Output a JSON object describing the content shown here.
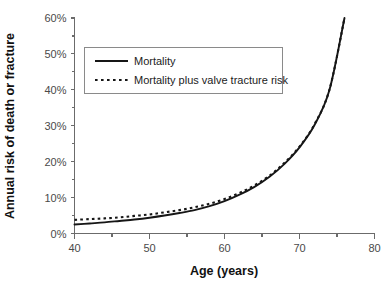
{
  "chart_data": {
    "type": "line",
    "title": "",
    "xlabel": "Age (years)",
    "ylabel": "Annual risk of death or fracture",
    "xlim": [
      40,
      80
    ],
    "ylim": [
      0,
      60
    ],
    "grid": false,
    "legend_position": "upper-left-inside",
    "x_ticks": [
      "40",
      "50",
      "60",
      "70",
      "80"
    ],
    "x_tick_values": [
      40,
      50,
      60,
      70,
      80
    ],
    "x_minor_tick_values": [
      45,
      55,
      65,
      75
    ],
    "y_ticks": [
      "0%",
      "10%",
      "20%",
      "30%",
      "40%",
      "50%",
      "60%"
    ],
    "y_tick_values": [
      0,
      10,
      20,
      30,
      40,
      50,
      60
    ],
    "x": [
      40,
      42,
      44,
      46,
      48,
      50,
      52,
      54,
      56,
      58,
      60,
      62,
      64,
      66,
      68,
      70,
      72,
      74,
      76
    ],
    "series": [
      {
        "name": "Mortality",
        "style": "solid",
        "values": [
          2.5,
          2.8,
          3.1,
          3.5,
          3.9,
          4.4,
          5.0,
          5.7,
          6.5,
          7.6,
          9.0,
          10.8,
          13.0,
          15.8,
          19.4,
          24.0,
          30.2,
          40.0,
          60.0
        ]
      },
      {
        "name": "Mortality plus valve tracture risk",
        "style": "dotted",
        "values": [
          3.8,
          4.0,
          4.2,
          4.5,
          4.9,
          5.3,
          5.9,
          6.5,
          7.3,
          8.3,
          9.6,
          11.3,
          13.4,
          16.1,
          19.7,
          24.2,
          30.4,
          40.1,
          60.0
        ]
      }
    ]
  },
  "legend": {
    "items": [
      {
        "label": "Mortality",
        "style": "solid"
      },
      {
        "label": "Mortality plus valve tracture risk",
        "style": "dotted"
      }
    ]
  },
  "colors": {
    "series_line": "#161616",
    "axis": "#6b6b6b",
    "tick_text": "#4a4a4a",
    "title_text": "#111111",
    "legend_border": "#8a8a8a",
    "background": "#ffffff"
  }
}
